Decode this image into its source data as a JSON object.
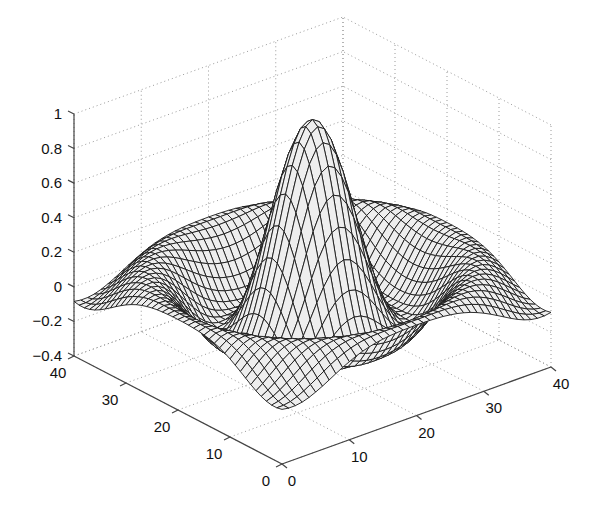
{
  "chart_data": {
    "type": "surface",
    "subtype": "3d-mesh",
    "title": "",
    "xlabel": "",
    "ylabel": "",
    "zlabel": "",
    "function": "sombrero: z = sin(r)/r, r = sqrt((x-20)^2 + (y-20)^2) scaled, on a 0..40 grid",
    "grid_size": 41,
    "x_range": [
      0,
      40
    ],
    "y_range": [
      0,
      40
    ],
    "zlim": [
      -0.4,
      1
    ],
    "peak": {
      "x": 20,
      "y": 20,
      "z": 1.0
    },
    "min_ring_z": -0.22,
    "corner_z": -0.2,
    "x_ticks": [
      0,
      10,
      20,
      30,
      40
    ],
    "y_ticks": [
      0,
      10,
      20,
      30,
      40
    ],
    "z_ticks": [
      -0.4,
      -0.2,
      0,
      0.2,
      0.4,
      0.6,
      0.8,
      1
    ],
    "x_tick_labels": [
      "0",
      "10",
      "20",
      "30",
      "40"
    ],
    "y_tick_labels": [
      "0",
      "10",
      "20",
      "30",
      "40"
    ],
    "z_tick_labels": [
      "−0.4",
      "−0.2",
      "0",
      "0.2",
      "0.4",
      "0.6",
      "0.8",
      "1"
    ],
    "grid": true,
    "legend": null,
    "colors": {
      "mesh_line": "#1a1a1a",
      "mesh_face": "#eeeeee",
      "gridline": "#9a9a9a",
      "axis": "#444444"
    }
  }
}
